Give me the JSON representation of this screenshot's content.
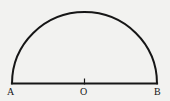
{
  "figure": {
    "kind": "semicircle-diagram",
    "background_color": "#f2f2f0",
    "stroke_color": "#161616",
    "arc_stroke_width": 2.0,
    "baseline_stroke_width": 2.2,
    "tick_stroke_width": 1.2,
    "labels": {
      "left_endpoint": "A",
      "center": "O",
      "right_endpoint": "B"
    },
    "geometry": {
      "center_x": 84.5,
      "baseline_y": 83.5,
      "radius_x": 72.5,
      "radius_y": 71.5,
      "arc_apex_y": 12.0,
      "left_endpoint_x": 12.0,
      "right_endpoint_x": 157.0,
      "center_tick_top_y": 78.5,
      "center_tick_bottom_y": 84.5
    }
  }
}
